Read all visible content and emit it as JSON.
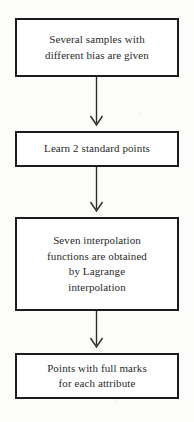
{
  "diagram": {
    "background_color": "#fcfcfb",
    "border_color": "#1b1b1b",
    "text_color": "#2a2a2a",
    "nodes": [
      {
        "id": "node-1",
        "name": "samples-given",
        "lines": [
          "Several samples with",
          "different bias are given"
        ]
      },
      {
        "id": "node-2",
        "name": "learn-standard-points",
        "lines": [
          "Learn 2 standard points"
        ]
      },
      {
        "id": "node-3",
        "name": "interpolation-functions",
        "lines": [
          "Seven interpolation",
          "functions are obtained",
          "by Lagrange",
          "interpolation"
        ]
      },
      {
        "id": "node-4",
        "name": "points-full-marks",
        "lines": [
          "Points with full marks",
          "for each attribute"
        ]
      }
    ],
    "connectors": [
      {
        "id": "connector-1",
        "from": "node-1",
        "to": "node-2",
        "style": "arrow-down"
      },
      {
        "id": "connector-2",
        "from": "node-2",
        "to": "node-3",
        "style": "arrow-down"
      },
      {
        "id": "connector-3",
        "from": "node-3",
        "to": "node-4",
        "style": "arrow-down"
      }
    ]
  }
}
